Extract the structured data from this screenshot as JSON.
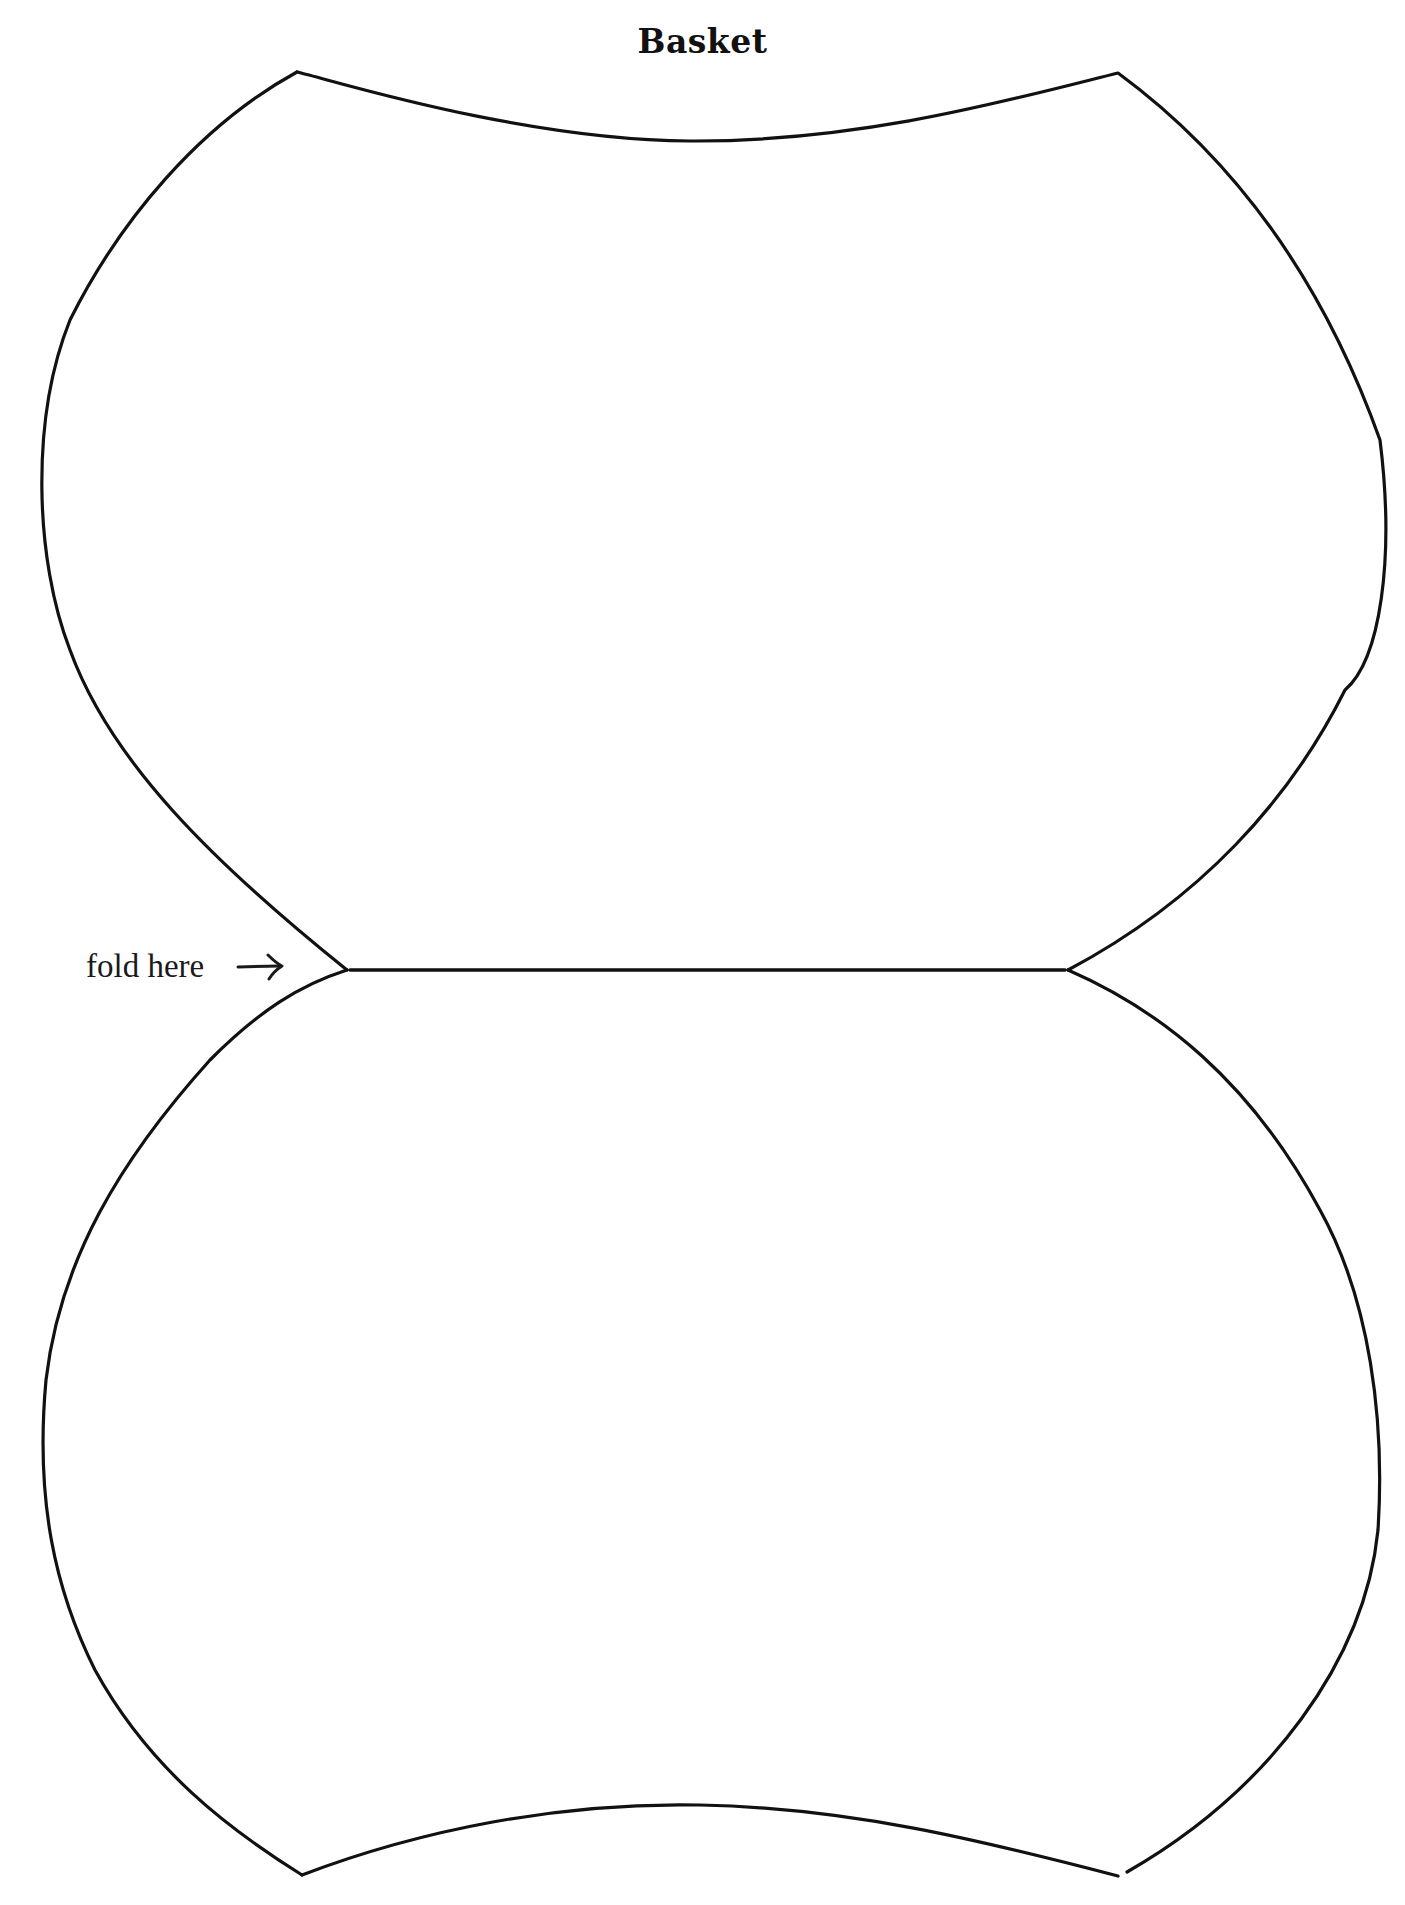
{
  "document": {
    "title": "Basket",
    "fold_label": "fold here",
    "fold_arrow_icon": "right-arrow-icon"
  },
  "template": {
    "line_color": "#111111",
    "background_color": "#ffffff",
    "top_lobe_path": "M 297 72 C 325 78, 520 140, 690 141 C 860 142, 1010 100, 1118 73 C 1250 170, 1330 300, 1380 440 C 1395 560, 1380 660, 1345 690 C 1290 800, 1200 900, 1068 970",
    "top_lobe_left_path": "M 297 72 C 200 125, 120 220, 70 320 C 30 420, 35 560, 70 650 C 110 760, 210 860, 347 970",
    "fold_line_path": "M 350 970 L 1065 970",
    "bottom_lobe_left_path": "M 347 970 C 300 985, 260 1010, 210 1060 C 120 1160, 60 1260, 46 1380 C 35 1500, 55 1590, 95 1670 C 150 1770, 230 1830, 302 1875",
    "bottom_lobe_bottom_path": "M 302 1875 C 420 1830, 560 1802, 700 1805 C 850 1808, 980 1840, 1118 1876",
    "bottom_lobe_right_path": "M 1068 970 C 1160 1010, 1250 1080, 1320 1210 C 1370 1300, 1385 1420, 1378 1530 C 1365 1660, 1270 1790, 1127 1872"
  }
}
